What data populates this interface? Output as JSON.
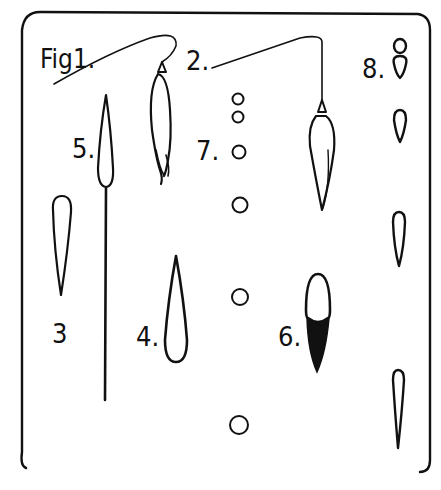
{
  "figure": {
    "labels": {
      "fig1": "Fig1.",
      "fig2": "2.",
      "fig3": "3",
      "fig4": "4.",
      "fig5": "5.",
      "fig6": "6.",
      "fig7": "7.",
      "fig8": "8."
    },
    "ink_color": "#111111",
    "background": "#ffffff",
    "elements": [
      {
        "id": "fig1",
        "description": "seed pendent on curved thread with slender elongated capsule"
      },
      {
        "id": "fig2",
        "description": "seed hanging from long thread with angular bend"
      },
      {
        "id": "fig3",
        "description": "narrow teardrop outline"
      },
      {
        "id": "fig4",
        "description": "teardrop outline pointing upward"
      },
      {
        "id": "fig5",
        "description": "pointed droplet atop long vertical stalk"
      },
      {
        "id": "fig6",
        "description": "oval, lower half filled black"
      },
      {
        "id": "fig7",
        "description": "vertical series of small circles of increasing spacing"
      },
      {
        "id": "fig8",
        "description": "series of drops on right column, stacked pair at top"
      }
    ]
  }
}
